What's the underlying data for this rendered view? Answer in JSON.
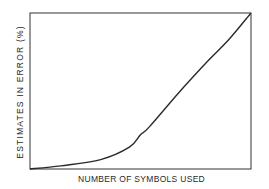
{
  "chart_data": {
    "type": "line",
    "title": "",
    "xlabel": "NUMBER OF SYMBOLS USED",
    "ylabel": "ESTIMATES IN ERROR (%)",
    "grid": false,
    "legend": null,
    "x_ticks": [],
    "y_ticks": [],
    "xlim": [
      0,
      1
    ],
    "ylim": [
      0,
      1
    ],
    "series": [
      {
        "name": "error curve",
        "x": [
          0.0,
          0.14,
          0.32,
          0.45,
          0.5,
          0.54,
          0.68,
          0.81,
          0.9,
          1.0
        ],
        "y": [
          0.0,
          0.02,
          0.06,
          0.14,
          0.22,
          0.27,
          0.5,
          0.7,
          0.83,
          1.0
        ]
      }
    ],
    "axes_color": "#333333",
    "line_color": "#2a2a2a"
  }
}
